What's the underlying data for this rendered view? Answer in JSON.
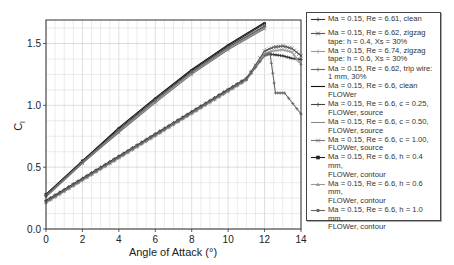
{
  "chart_data": {
    "type": "line",
    "title": "",
    "xlabel": "Angle of Attack (°)",
    "ylabel": "Cl",
    "xlim": [
      0,
      14
    ],
    "ylim": [
      0,
      1.69
    ],
    "xticks": [
      0,
      2,
      4,
      6,
      8,
      10,
      12,
      14
    ],
    "xtick_labels": [
      "0",
      "2",
      "4",
      "6",
      "8",
      "10",
      "12",
      "14"
    ],
    "yticks": [
      0.0,
      0.5,
      1.0,
      1.5
    ],
    "ytick_labels": [
      "0.0",
      "0.5",
      "1.0",
      "1.5"
    ],
    "grid": true,
    "legend_position": "right, outside plot",
    "series": [
      {
        "name": "Ma = 0.15, Re = 6.61, clean",
        "color": "#333333",
        "marker": "plus",
        "x": [
          0,
          1,
          2,
          3,
          4,
          5,
          6,
          7,
          8,
          9,
          10,
          11,
          12,
          12.5,
          13,
          13.5,
          14
        ],
        "y": [
          0.23,
          0.32,
          0.41,
          0.5,
          0.59,
          0.68,
          0.77,
          0.86,
          0.95,
          1.04,
          1.13,
          1.22,
          1.42,
          1.41,
          1.4,
          1.38,
          1.37
        ]
      },
      {
        "name": "Ma = 0.15, Re = 6.62, zigzag tape: h = 0.4, Xs = 30%",
        "color": "#555555",
        "marker": "x",
        "x": [
          0,
          1,
          2,
          3,
          4,
          5,
          6,
          7,
          8,
          9,
          10,
          11,
          12,
          12.5,
          13,
          13.5,
          14
        ],
        "y": [
          0.22,
          0.31,
          0.4,
          0.49,
          0.58,
          0.67,
          0.76,
          0.85,
          0.94,
          1.03,
          1.12,
          1.21,
          1.44,
          1.47,
          1.48,
          1.46,
          1.4
        ]
      },
      {
        "name": "Ma = 0.15, Re = 6.74, zigzag tape: h = 0.6, Xs = 30%",
        "color": "#9a9a9a",
        "marker": "plus",
        "x": [
          0,
          1,
          2,
          3,
          4,
          5,
          6,
          7,
          8,
          9,
          10,
          11,
          12,
          12.5,
          13,
          13.5,
          14
        ],
        "y": [
          0.21,
          0.3,
          0.39,
          0.48,
          0.57,
          0.66,
          0.75,
          0.84,
          0.93,
          1.02,
          1.11,
          1.2,
          1.42,
          1.44,
          1.45,
          1.43,
          1.33
        ]
      },
      {
        "name": "Ma = 0.15, Re = 6.62, trip wire: 1 mm, 30%",
        "color": "#666666",
        "marker": "plus",
        "x": [
          0,
          1,
          2,
          3,
          4,
          5,
          6,
          7,
          8,
          9,
          10,
          11,
          12,
          12.3,
          12.6,
          13.1,
          14
        ],
        "y": [
          0.22,
          0.31,
          0.4,
          0.49,
          0.58,
          0.67,
          0.76,
          0.85,
          0.94,
          1.03,
          1.12,
          1.21,
          1.4,
          1.42,
          1.1,
          1.1,
          0.93
        ]
      },
      {
        "name": "Ma = 0.15, Re = 6.6, clean FLOWer",
        "color": "#111111",
        "marker": "none",
        "x": [
          0,
          2,
          4,
          6,
          8,
          10,
          12
        ],
        "y": [
          0.28,
          0.55,
          0.82,
          1.06,
          1.29,
          1.49,
          1.67
        ]
      },
      {
        "name": "Ma = 0.15, Re = 6.6, c = 0.25, FLOWer, source",
        "color": "#444444",
        "marker": "plus",
        "x": [
          0,
          2,
          4,
          6,
          8,
          10,
          12
        ],
        "y": [
          0.27,
          0.54,
          0.8,
          1.04,
          1.27,
          1.47,
          1.64
        ]
      },
      {
        "name": "Ma = 0.15, Re = 6.6, c = 0.50, FLOWer, source",
        "color": "#8a8a8a",
        "marker": "none",
        "x": [
          0,
          2,
          4,
          6,
          8,
          10,
          12
        ],
        "y": [
          0.26,
          0.53,
          0.79,
          1.03,
          1.26,
          1.46,
          1.63
        ]
      },
      {
        "name": "Ma = 0.15, Re = 6.6, c = 1.00, FLOWer, source",
        "color": "#777777",
        "marker": "x",
        "x": [
          0,
          2,
          4,
          6,
          8,
          10,
          12
        ],
        "y": [
          0.26,
          0.53,
          0.78,
          1.02,
          1.25,
          1.45,
          1.62
        ]
      },
      {
        "name": "Ma = 0.15, Re = 6.6, h = 0.4 mm, FLOWer, contour",
        "color": "#222222",
        "marker": "square",
        "x": [
          0,
          2,
          4,
          6,
          8,
          10,
          12
        ],
        "y": [
          0.28,
          0.55,
          0.81,
          1.05,
          1.28,
          1.48,
          1.66
        ]
      },
      {
        "name": "Ma = 0.15, Re = 6.6, h = 0.6 mm, FLOWer, contour",
        "color": "#999999",
        "marker": "triangle",
        "x": [
          0,
          2,
          4,
          6,
          8,
          10,
          12
        ],
        "y": [
          0.27,
          0.54,
          0.8,
          1.04,
          1.27,
          1.47,
          1.65
        ]
      },
      {
        "name": "Ma = 0.15, Re = 6.6, h = 1.0 mm, FLOWer, contour",
        "color": "#666666",
        "marker": "circle",
        "x": [
          0,
          2,
          4,
          6,
          8,
          10,
          12
        ],
        "y": [
          0.27,
          0.54,
          0.8,
          1.04,
          1.27,
          1.47,
          1.64
        ]
      }
    ]
  },
  "legend": {
    "items": [
      {
        "text": "Ma = 0.15, Re = 6.61, clean",
        "symbol": "plus",
        "color": "#333333"
      },
      {
        "text": "Ma = 0.15, Re = 6.62, zigzag\ntape: h = 0.4, Xs = 30%",
        "symbol": "x",
        "color": "#555555"
      },
      {
        "text": "Ma = 0.15, Re = 6.74, zigzag\ntape: h = 0.6, Xs = 30%",
        "symbol": "plus",
        "color": "#9a9a9a"
      },
      {
        "text": "Ma = 0.15, Re = 6.62, trip wire:\n1 mm, 30%",
        "symbol": "plus",
        "color": "#666666"
      },
      {
        "text": "Ma = 0.15, Re = 6.6, clean\nFLOWer",
        "symbol": "none",
        "color": "#111111"
      },
      {
        "text": "Ma = 0.15, Re = 6.6, c = 0.25,\nFLOWer, source",
        "symbol": "plus",
        "color": "#444444"
      },
      {
        "text": "Ma = 0.15, Re = 6.6, c = 0.50,\nFLOWer, source",
        "symbol": "none",
        "color": "#8a8a8a"
      },
      {
        "text": "Ma = 0.15, Re = 6.6, c = 1.00,\nFLOWer, source",
        "symbol": "x",
        "color": "#777777"
      },
      {
        "text": "Ma = 0.15, Re = 6.6, h = 0.4 mm,\nFLOWer, contour",
        "symbol": "square",
        "color": "#222222"
      },
      {
        "text": "Ma = 0.15, Re = 6.6, h = 0.6 mm,\nFLOWer, contour",
        "symbol": "triangle",
        "color": "#999999"
      },
      {
        "text": "Ma = 0.15, Re = 6.6, h = 1.0 mm,\nFLOWer, contour",
        "symbol": "circle",
        "color": "#666666"
      }
    ]
  },
  "axes": {
    "xlabel": "Angle of Attack (°)",
    "ylabel_main": "C",
    "ylabel_sub": "l"
  }
}
